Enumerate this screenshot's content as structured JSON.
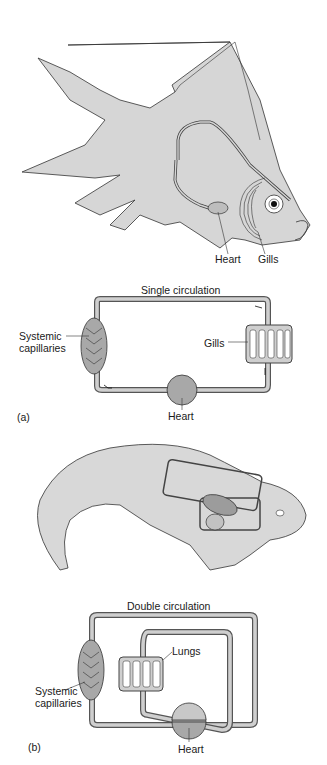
{
  "panel_a": {
    "letter": "(a)",
    "fish_labels": {
      "heart": "Heart",
      "gills": "Gills"
    },
    "schematic": {
      "title": "Single circulation",
      "systemic_line1": "Systemic",
      "systemic_line2": "capillaries",
      "gills": "Gills",
      "heart": "Heart"
    }
  },
  "panel_b": {
    "letter": "(b)",
    "schematic": {
      "title": "Double circulation",
      "lungs": "Lungs",
      "systemic_line1": "Systemic",
      "systemic_line2": "capillaries",
      "heart": "Heart"
    }
  },
  "colors": {
    "body_fill": "#d4d4d4",
    "vessel_fill": "#c8c8c8",
    "outline": "#333333",
    "organ_fill": "#a9a9a9"
  }
}
